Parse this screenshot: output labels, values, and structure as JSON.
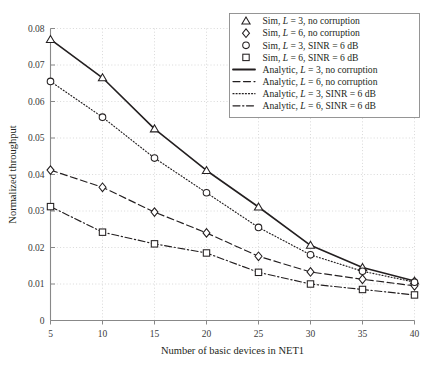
{
  "chart_data": {
    "type": "line",
    "title": "",
    "xlabel": "Number of basic devices in NET1",
    "ylabel": "Normalized throughput",
    "x": [
      5,
      10,
      15,
      20,
      25,
      30,
      35,
      40
    ],
    "xlim": [
      5,
      40
    ],
    "ylim": [
      0,
      0.08
    ],
    "xticks": [
      "5",
      "10",
      "15",
      "20",
      "25",
      "30",
      "35",
      "40"
    ],
    "yticks": [
      "0",
      "0.01",
      "0.02",
      "0.03",
      "0.04",
      "0.05",
      "0.06",
      "0.07",
      "0.08"
    ],
    "ytick_values": [
      0,
      0.01,
      0.02,
      0.03,
      0.04,
      0.05,
      0.06,
      0.07,
      0.08
    ],
    "grid": "dotted",
    "legend_position": "upper right",
    "series": [
      {
        "name": "Sim, L = 3, no corruption",
        "marker": "triangle",
        "style": "markers",
        "values": [
          0.077,
          0.0665,
          0.0525,
          0.0411,
          0.0311,
          0.0206,
          0.0145,
          0.0108
        ]
      },
      {
        "name": "Sim, L = 6, no corruption",
        "marker": "diamond",
        "style": "markers",
        "values": [
          0.0412,
          0.0365,
          0.0297,
          0.024,
          0.0176,
          0.0133,
          0.0113,
          0.0095
        ]
      },
      {
        "name": "Sim, L = 3, SINR = 6 dB",
        "marker": "circle",
        "style": "markers",
        "values": [
          0.0655,
          0.0557,
          0.0445,
          0.035,
          0.0255,
          0.018,
          0.0135,
          0.0105
        ]
      },
      {
        "name": "Sim, L = 6, SINR = 6 dB",
        "marker": "square",
        "style": "markers",
        "values": [
          0.0312,
          0.0242,
          0.021,
          0.0185,
          0.0132,
          0.01,
          0.0085,
          0.007
        ]
      },
      {
        "name": "Analytic, L = 3, no corruption",
        "marker": "none",
        "style": "solid",
        "values": [
          0.077,
          0.0665,
          0.0525,
          0.0411,
          0.0311,
          0.0206,
          0.0145,
          0.0108
        ]
      },
      {
        "name": "Analytic, L = 6, no corruption",
        "marker": "none",
        "style": "dashed",
        "values": [
          0.0412,
          0.0365,
          0.0297,
          0.024,
          0.0176,
          0.0133,
          0.0113,
          0.0095
        ]
      },
      {
        "name": "Analytic, L = 3, SINR = 6 dB",
        "marker": "none",
        "style": "dotted",
        "values": [
          0.0655,
          0.0557,
          0.0445,
          0.035,
          0.0255,
          0.018,
          0.0135,
          0.0105
        ]
      },
      {
        "name": "Analytic, L = 6, SINR = 6 dB",
        "marker": "none",
        "style": "dashdot",
        "values": [
          0.0312,
          0.0242,
          0.021,
          0.0185,
          0.0132,
          0.01,
          0.0085,
          0.007
        ]
      }
    ]
  },
  "axes": {
    "xlabel": "Number of basic devices in NET1",
    "ylabel": "Normalized throughput",
    "xticks": [
      "5",
      "10",
      "15",
      "20",
      "25",
      "30",
      "35",
      "40"
    ],
    "yticks": [
      "0",
      "0.01",
      "0.02",
      "0.03",
      "0.04",
      "0.05",
      "0.06",
      "0.07",
      "0.08"
    ]
  },
  "legend": {
    "entries": [
      {
        "marker": "triangle",
        "style": "markers",
        "prefix": "Sim, ",
        "sym": "L",
        "suffix": " = 3, no corruption"
      },
      {
        "marker": "diamond",
        "style": "markers",
        "prefix": "Sim, ",
        "sym": "L",
        "suffix": " = 6, no corruption"
      },
      {
        "marker": "circle",
        "style": "markers",
        "prefix": "Sim, ",
        "sym": "L",
        "suffix": " = 3, SINR = 6 dB"
      },
      {
        "marker": "square",
        "style": "markers",
        "prefix": "Sim, ",
        "sym": "L",
        "suffix": " = 6, SINR = 6 dB"
      },
      {
        "marker": "none",
        "style": "solid",
        "prefix": "Analytic, ",
        "sym": "L",
        "suffix": " = 3, no corruption"
      },
      {
        "marker": "none",
        "style": "dashed",
        "prefix": "Analytic, ",
        "sym": "L",
        "suffix": " = 6, no corruption"
      },
      {
        "marker": "none",
        "style": "dotted",
        "prefix": "Analytic, ",
        "sym": "L",
        "suffix": " = 3, SINR = 6 dB"
      },
      {
        "marker": "none",
        "style": "dashdot",
        "prefix": "Analytic, ",
        "sym": "L",
        "suffix": " = 6, SINR = 6 dB"
      }
    ]
  },
  "colors": {
    "line": "#231f20",
    "grid": "#c8c8c8",
    "axis": "#888888",
    "text": "#231f20",
    "background": "#ffffff"
  }
}
